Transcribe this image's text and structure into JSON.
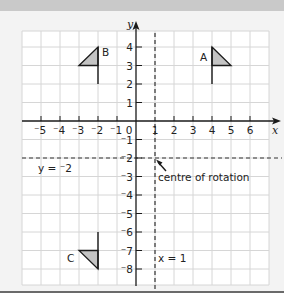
{
  "figure": {
    "axes": {
      "x_label": "x",
      "y_label": "y",
      "x_tick_labels": [
        "⁻5",
        "⁻4",
        "⁻3",
        "⁻2",
        "⁻1",
        "0",
        "1",
        "2",
        "3",
        "4",
        "5",
        "6"
      ],
      "y_tick_labels_positive": [
        "4",
        "3",
        "2",
        "1"
      ],
      "y_tick_labels_negative": [
        "⁻1",
        "⁻2",
        "⁻3",
        "⁻4",
        "⁻5",
        "⁻6",
        "⁻7",
        "⁻8"
      ]
    },
    "lines": {
      "horizontal_label": "y = ⁻2",
      "vertical_label": "x = 1"
    },
    "annotation": {
      "centre_label": "centre of rotation"
    },
    "shapes": {
      "A": {
        "label": "A"
      },
      "B": {
        "label": "B"
      },
      "C": {
        "label": "C"
      }
    },
    "colors": {
      "grid": "#d6d6d6",
      "shape_fill": "#c4c4c4",
      "ink": "#1a1a1a",
      "panel": "#f3f3f3"
    }
  }
}
